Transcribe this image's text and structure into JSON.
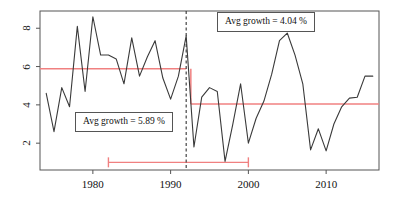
{
  "chart_data": {
    "type": "line",
    "title": "",
    "xlabel": "",
    "ylabel": "",
    "xlim": [
      1973.2,
      2016.8
    ],
    "ylim": [
      0.6,
      8.9
    ],
    "grid": false,
    "legend": "none",
    "x": [
      1974,
      1975,
      1976,
      1977,
      1978,
      1979,
      1980,
      1981,
      1982,
      1983,
      1984,
      1985,
      1986,
      1987,
      1988,
      1989,
      1990,
      1991,
      1992,
      1993,
      1994,
      1995,
      1996,
      1997,
      1998,
      1999,
      2000,
      2001,
      2002,
      2003,
      2004,
      2005,
      2006,
      2007,
      2008,
      2009,
      2010,
      2011,
      2012,
      2013,
      2014,
      2015,
      2016
    ],
    "series": [
      {
        "name": "growth",
        "color": "#3a3a3a",
        "values": [
          4.6,
          2.6,
          4.9,
          3.9,
          8.1,
          4.7,
          8.6,
          6.6,
          6.6,
          6.4,
          5.1,
          7.5,
          5.5,
          6.5,
          7.35,
          5.4,
          4.3,
          5.5,
          7.6,
          1.8,
          4.4,
          4.9,
          4.7,
          1.05,
          3.0,
          5.1,
          2.0,
          3.3,
          4.2,
          5.6,
          7.35,
          7.75,
          6.6,
          5.1,
          1.65,
          2.75,
          1.6,
          3.0,
          3.9,
          4.35,
          4.4,
          5.5,
          5.5
        ]
      }
    ],
    "breakpoint": {
      "year": 1992,
      "style": "dashed",
      "color": "#333333"
    },
    "mean_segments": [
      {
        "label": "segment-1",
        "x_start": 1973.2,
        "x_end": 1992.0,
        "value": 5.89,
        "color": "#F08080"
      },
      {
        "label": "segment-2",
        "x_start": 1992.6,
        "x_end": 2016.8,
        "value": 4.04,
        "color": "#F08080"
      }
    ],
    "confidence_interval": {
      "x_start": 1982.0,
      "x_end": 2000.0,
      "y": 1.0,
      "color": "#F08080"
    },
    "xticks": [
      1980,
      1990,
      2000,
      2010
    ],
    "xtick_labels": [
      "1980",
      "1990",
      "2000",
      "2010"
    ],
    "yticks": [
      2,
      4,
      6,
      8
    ],
    "ytick_labels": [
      "2",
      "4",
      "6",
      "8"
    ]
  },
  "annotations": {
    "right_box": "Avg growth = 4.04 %",
    "left_box": "Avg growth = 5.89 %"
  },
  "colors": {
    "series": "#3a3a3a",
    "mean_line": "#F08080",
    "breakpoint": "#333333",
    "axis": "#555555",
    "background": "#ffffff"
  }
}
